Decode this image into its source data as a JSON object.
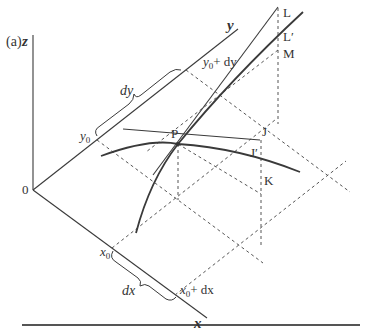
{
  "figure": {
    "panel_label": "(a)",
    "axes": {
      "x": "x",
      "y": "y",
      "z": "z",
      "origin": "0"
    },
    "labels": {
      "x0": "x",
      "x0_sub": "0",
      "x0_plus_dx": "+ dx",
      "dx": "dx",
      "y0": "y",
      "y0_sub": "0",
      "y0_plus_dy": "+ dy",
      "dy": "dy",
      "P": "P",
      "J": "J",
      "J_prime": "J′",
      "K": "K",
      "L": "L",
      "L_prime": "L′",
      "M": "M"
    },
    "colors": {
      "line": "#3a3a3a",
      "dashed": "#555555",
      "background": "#ffffff"
    }
  }
}
